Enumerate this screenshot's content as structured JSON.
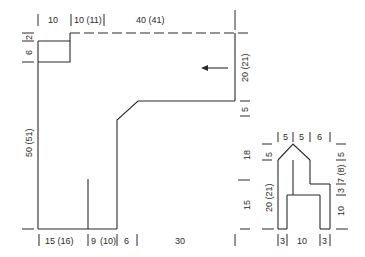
{
  "diagram": {
    "main_piece": {
      "top_dims": [
        "10",
        "10 (11)",
        "40 (41)"
      ],
      "left_dims": [
        "2",
        "6",
        "50 (51)"
      ],
      "right_dims": [
        "20 (21)",
        "5"
      ],
      "bottom_dims": [
        "15 (16)",
        "9",
        "(10)",
        "6",
        "30"
      ]
    },
    "small_piece": {
      "top_dims": [
        "5",
        "5",
        "6"
      ],
      "left_dims": [
        "18",
        "5",
        "15",
        "20 (21)"
      ],
      "right_dims": [
        "5",
        "7 (8)",
        "3",
        "10"
      ],
      "bottom_dims": [
        "3",
        "10",
        "3"
      ]
    },
    "arrow": "arrow-left"
  }
}
